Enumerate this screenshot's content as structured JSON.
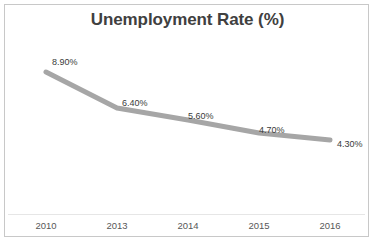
{
  "chart_data": {
    "type": "line",
    "title": "Unemployment Rate (%)",
    "xlabel": "",
    "ylabel": "",
    "categories": [
      "2010",
      "2013",
      "2014",
      "2015",
      "2016"
    ],
    "values": [
      8.9,
      6.4,
      5.6,
      4.7,
      4.3
    ],
    "data_labels": [
      "8.90%",
      "6.40%",
      "5.60%",
      "4.70%",
      "4.30%"
    ],
    "series": [
      {
        "name": "Unemployment Rate",
        "values": [
          8.9,
          6.4,
          5.6,
          4.7,
          4.3
        ],
        "color": "#A6A6A6"
      }
    ],
    "ylim": [
      0,
      10
    ],
    "grid": false,
    "legend": false,
    "legend_position": "none",
    "markers": false,
    "line_width": 5,
    "label_unit": "%"
  },
  "style": {
    "title_color": "#404040",
    "line_color": "#A6A6A6",
    "label_color": "#3a3a3a",
    "tick_color": "#585858",
    "border_color": "#c8c8c8",
    "axis_color": "#e6e6e6",
    "background": "#ffffff"
  },
  "geometry": {
    "points_x": [
      46,
      117,
      188,
      259,
      330
    ],
    "points_y": [
      72,
      108,
      120,
      133,
      140
    ],
    "label_offsets": [
      {
        "x": 52,
        "y": 58
      },
      {
        "x": 122,
        "y": 99
      },
      {
        "x": 188,
        "y": 112
      },
      {
        "x": 259,
        "y": 126
      },
      {
        "x": 337,
        "y": 140
      }
    ]
  },
  "ticks": {
    "labels": [
      "2010",
      "2013",
      "2014",
      "2015",
      "2016"
    ],
    "x": [
      46,
      117,
      188,
      259,
      330
    ]
  }
}
